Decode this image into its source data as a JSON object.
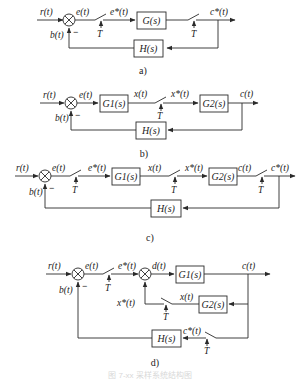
{
  "diagrams": {
    "a": {
      "caption": "a)",
      "signals": {
        "r": "r(t)",
        "e": "e(t)",
        "e_star": "e*(t)",
        "c_star": "c*(t)",
        "b": "b(t)"
      },
      "blocks": {
        "G": "G(s)",
        "H": "H(s)"
      },
      "sampler_period": "T",
      "feedback_sign": "−"
    },
    "b": {
      "caption": "b)",
      "signals": {
        "r": "r(t)",
        "e": "e(t)",
        "x": "x(t)",
        "x_star": "x*(t)",
        "c": "c(t)",
        "b": "b(t)"
      },
      "blocks": {
        "G1": "G1(s)",
        "G2": "G2(s)",
        "H": "H(s)"
      },
      "sampler_period": "T",
      "feedback_sign": "−"
    },
    "c": {
      "caption": "c)",
      "signals": {
        "r": "r(t)",
        "e": "e(t)",
        "e_star": "e*(t)",
        "x": "x(t)",
        "x_star": "x*(t)",
        "c": "c(t)",
        "c_star": "c*(t)",
        "b": "b(t)"
      },
      "blocks": {
        "G1": "G1(s)",
        "G2": "G2(s)",
        "H": "H(s)"
      },
      "sampler_period": "T",
      "feedback_sign": "−"
    },
    "d": {
      "caption": "d)",
      "signals": {
        "r": "r(t)",
        "e": "e(t)",
        "e_star": "e*(t)",
        "d": "d(t)",
        "c": "c(t)",
        "x": "x(t)",
        "x_star": "x*(t)",
        "c_star": "c*(t)",
        "b": "b(t)"
      },
      "blocks": {
        "G1": "G1(s)",
        "G2": "G2(s)",
        "H": "H(s)"
      },
      "sampler_period": "T",
      "feedback_sign": "−"
    }
  },
  "figure_caption": "图 7-xx 采样系统结构图"
}
